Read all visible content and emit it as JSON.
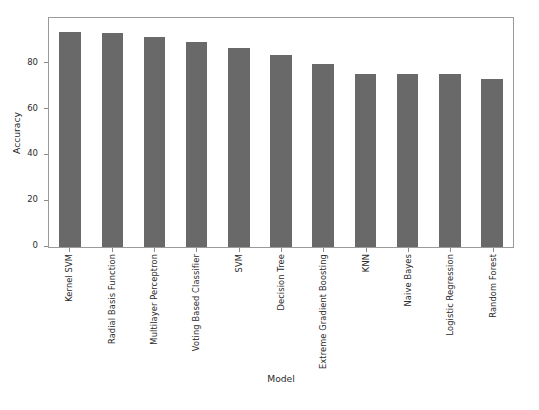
{
  "chart_data": {
    "type": "bar",
    "title": "",
    "xlabel": "Model",
    "ylabel": "Accuracy",
    "categories": [
      "Kernel SVM",
      "Radial Basis Function",
      "Multilayer Perceptron",
      "Voting Based Classifier",
      "SVM",
      "Decision Tree",
      "Extreme Gradient Boosting",
      "KNN",
      "Naive Bayes",
      "Logistic Regression",
      "Random Forest"
    ],
    "values": [
      94,
      93.5,
      91.5,
      89.5,
      87,
      84,
      80,
      75.5,
      75.5,
      75.5,
      73.5
    ],
    "ylim": [
      0,
      100
    ],
    "yticks": [
      0,
      20,
      40,
      60,
      80
    ],
    "ytick_labels": [
      "0",
      "20",
      "40",
      "60",
      "80"
    ],
    "grid": false,
    "legend": null,
    "bar_color": "#696969",
    "frame_color": "#9a9a9a",
    "background": "#ffffff"
  }
}
